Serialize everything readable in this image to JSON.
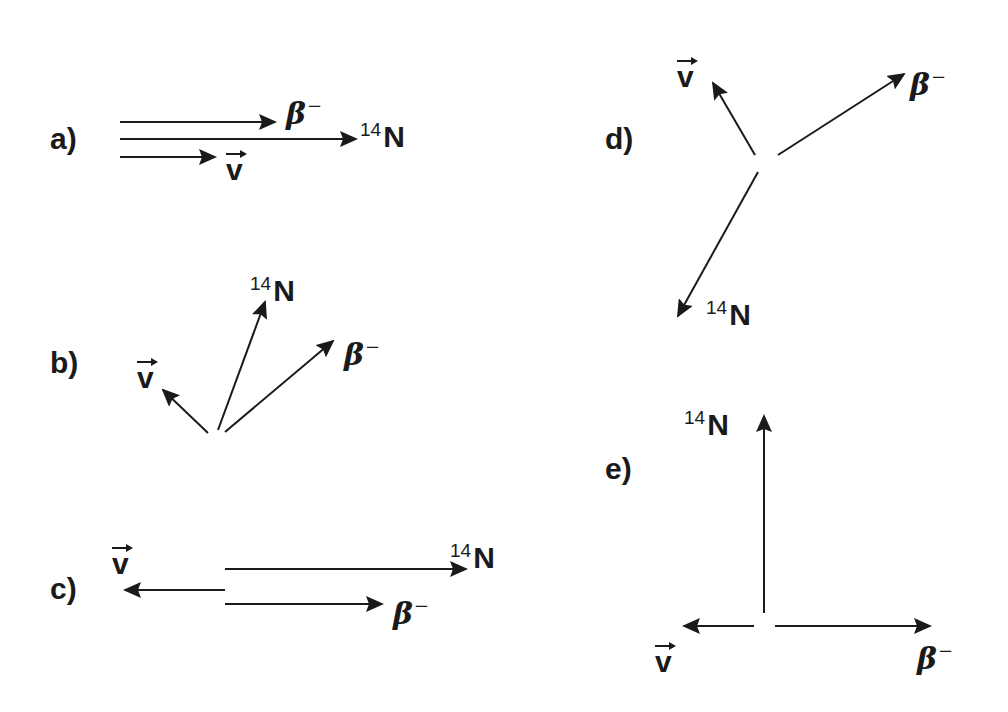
{
  "diagram": {
    "panels": [
      {
        "id": "a",
        "label": "a)",
        "vectors": [
          {
            "particle": "beta_minus",
            "direction": "right",
            "from": [
              120,
              122
            ],
            "to": [
              275,
              122
            ]
          },
          {
            "particle": "N14",
            "direction": "right",
            "from": [
              120,
              139
            ],
            "to": [
              356,
              139
            ]
          },
          {
            "particle": "antineutrino",
            "direction": "right",
            "from": [
              120,
              157
            ],
            "to": [
              215,
              157
            ]
          }
        ]
      },
      {
        "id": "b",
        "label": "b)",
        "vectors": [
          {
            "particle": "antineutrino",
            "direction": "up-left",
            "from": [
              208,
              433
            ],
            "to": [
              163,
              390
            ]
          },
          {
            "particle": "N14",
            "direction": "up-right",
            "from": [
              218,
              430
            ],
            "to": [
              265,
              302
            ]
          },
          {
            "particle": "beta_minus",
            "direction": "up-right",
            "from": [
              225,
              432
            ],
            "to": [
              333,
              341
            ]
          }
        ]
      },
      {
        "id": "c",
        "label": "c)",
        "vectors": [
          {
            "particle": "antineutrino",
            "direction": "left",
            "from": [
              225,
              590
            ],
            "to": [
              125,
              590
            ]
          },
          {
            "particle": "N14",
            "direction": "right",
            "from": [
              225,
              569
            ],
            "to": [
              466,
              569
            ]
          },
          {
            "particle": "beta_minus",
            "direction": "right",
            "from": [
              225,
              604
            ],
            "to": [
              382,
              604
            ]
          }
        ]
      },
      {
        "id": "d",
        "label": "d)",
        "vectors": [
          {
            "particle": "antineutrino",
            "direction": "up-left",
            "from": [
              755,
              155
            ],
            "to": [
              713,
              83
            ]
          },
          {
            "particle": "beta_minus",
            "direction": "up-right",
            "from": [
              778,
              155
            ],
            "to": [
              904,
              74
            ]
          },
          {
            "particle": "N14",
            "direction": "down-left",
            "from": [
              758,
              172
            ],
            "to": [
              678,
              316
            ]
          }
        ]
      },
      {
        "id": "e",
        "label": "e)",
        "vectors": [
          {
            "particle": "N14",
            "direction": "up",
            "from": [
              764,
              613
            ],
            "to": [
              764,
              416
            ]
          },
          {
            "particle": "antineutrino",
            "direction": "left",
            "from": [
              754,
              626
            ],
            "to": [
              684,
              626
            ]
          },
          {
            "particle": "beta_minus",
            "direction": "right",
            "from": [
              775,
              626
            ],
            "to": [
              930,
              626
            ]
          }
        ]
      }
    ],
    "symbols": {
      "beta": "β",
      "beta_charge": "−",
      "nitrogen_mass": "14",
      "nitrogen": "N",
      "antineutrino": "v"
    },
    "colors": {
      "ink": "#1a1a1a",
      "background": "#ffffff"
    }
  }
}
